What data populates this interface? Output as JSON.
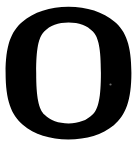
{
  "canvas": {
    "width": 137,
    "height": 147,
    "background_color": "#ffffff"
  },
  "glyph": {
    "character": "O",
    "name": "latin-capital-letter-o",
    "style": "serif",
    "color": "#000000",
    "bounds": {
      "left": 6,
      "top": 7,
      "right": 130,
      "bottom": 139,
      "width": 124,
      "height": 132
    },
    "counter": {
      "left": 37,
      "top": 23,
      "right": 101,
      "bottom": 123,
      "width": 64,
      "height": 100,
      "color": "#ffffff"
    },
    "stroke_weights": {
      "left_side": 31,
      "right_side": 29,
      "top": 16,
      "bottom": 16
    }
  }
}
